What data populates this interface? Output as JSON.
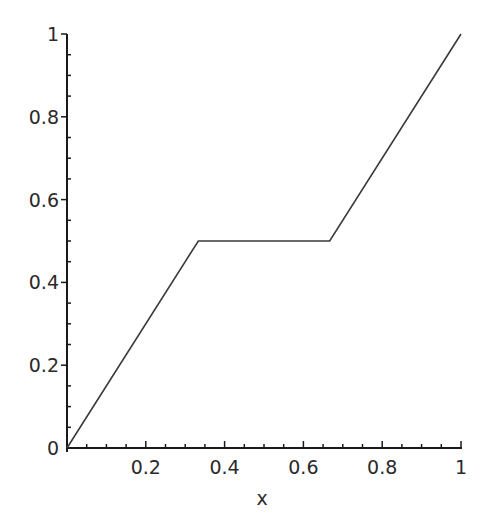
{
  "chart_data": {
    "type": "line",
    "title": "",
    "xlabel": "x",
    "ylabel": "",
    "xlim": [
      0,
      1
    ],
    "ylim": [
      0,
      1
    ],
    "grid": false,
    "legend": null,
    "x_ticks": [
      "0.2",
      "0.4",
      "0.6",
      "0.8",
      "1"
    ],
    "y_ticks": [
      "0",
      "0.2",
      "0.4",
      "0.6",
      "0.8",
      "1"
    ],
    "series": [
      {
        "name": "f(x)",
        "x": [
          0,
          0.3333,
          0.6667,
          1
        ],
        "y": [
          0,
          0.5,
          0.5,
          1
        ]
      }
    ]
  },
  "colors": {
    "axis": "#1a1a1a",
    "line": "#3a3a3a"
  }
}
